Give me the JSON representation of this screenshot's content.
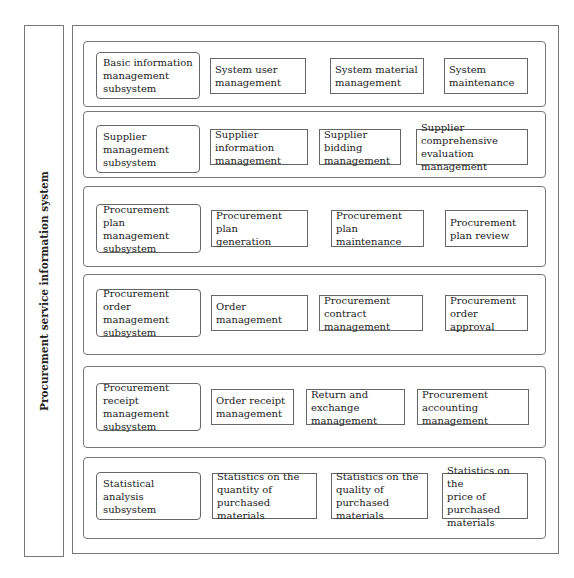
{
  "system_title": "Procurement service information system",
  "groups": [
    {
      "subsystem": "Basic information\nmanagement\nsubsystem",
      "modules": [
        "System user\nmanagement",
        "System material\nmanagement",
        "System\nmaintenance"
      ]
    },
    {
      "subsystem": "Supplier management\nsubsystem",
      "modules": [
        "Supplier information\nmanagement",
        "Supplier bidding\nmanagement",
        "Supplier comprehensive\nevaluation management"
      ]
    },
    {
      "subsystem": "Procurement plan\nmanagement\nsubsystem",
      "modules": [
        "Procurement plan\ngeneration",
        "Procurement plan\nmaintenance",
        "Procurement\nplan review"
      ]
    },
    {
      "subsystem": "Procurement order\nmanagement\nsubsystem",
      "modules": [
        "Order management",
        "Procurement contract\nmanagement",
        "Procurement\norder approval"
      ]
    },
    {
      "subsystem": "Procurement receipt\nmanagement\nsubsystem",
      "modules": [
        "Order receipt\nmanagement",
        "Return and exchange\nmanagement",
        "Procurement accounting\nmanagement"
      ]
    },
    {
      "subsystem": "Statistical analysis\nsubsystem",
      "modules": [
        "Statistics on the\nquantity of purchased\nmaterials",
        "Statistics on the\nquality of purchased\nmaterials",
        "Statistics on the\nprice of purchased\nmaterials"
      ]
    }
  ]
}
